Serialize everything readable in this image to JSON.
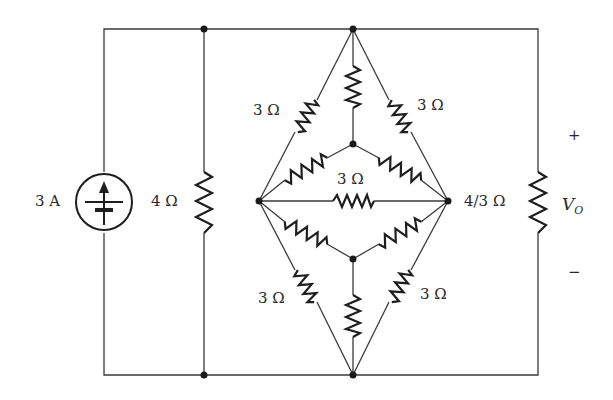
{
  "diagram": {
    "type": "circuit",
    "source": {
      "label": "3 A",
      "kind": "current-source",
      "direction": "up"
    },
    "resistors": {
      "shunt": "4 Ω",
      "outer_top_left": "3 Ω",
      "outer_top_right": "3 Ω",
      "center_horizontal": "3 Ω",
      "outer_bottom_left": "3 Ω",
      "outer_bottom_right": "3 Ω",
      "load": "4/3 Ω"
    },
    "output": {
      "label": "V",
      "subscript": "O",
      "plus": "+",
      "minus": "−"
    }
  }
}
